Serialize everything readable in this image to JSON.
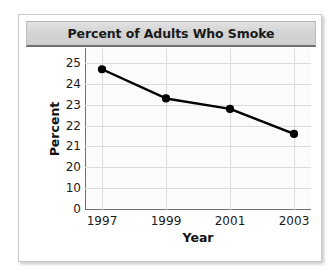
{
  "chart_data": {
    "type": "line",
    "title": "Percent of Adults Who Smoke",
    "xlabel": "Year",
    "ylabel": "Percent",
    "categories": [
      "1997",
      "1999",
      "2001",
      "2003"
    ],
    "x": [
      1997,
      1999,
      2001,
      2003
    ],
    "values": [
      24.7,
      23.3,
      22.8,
      21.6
    ],
    "series": [
      {
        "name": "Percent of adults who smoke",
        "values": [
          24.7,
          23.3,
          22.8,
          21.6
        ]
      }
    ],
    "ytick_labels": [
      "0",
      "10",
      "20",
      "21",
      "22",
      "23",
      "24",
      "25"
    ],
    "ytick_values": [
      0,
      10,
      20,
      21,
      22,
      23,
      24,
      25
    ],
    "xtick_labels": [
      "1997",
      "1999",
      "2001",
      "2003"
    ],
    "ylim": [
      0,
      25
    ],
    "xlim": [
      1997,
      2003
    ],
    "axis_note": "broken y-axis: equal spacing between 0, 10, 20 and each unit from 20 to 25",
    "grid": true,
    "legend": false,
    "legend_position": "none",
    "marker": "filled-circle",
    "line_color": "#000000",
    "marker_color": "#000000",
    "grid_color": "#dcdcdc",
    "plot_background": "#fbfbfb",
    "title_banner_color": "#d4d4d4"
  }
}
